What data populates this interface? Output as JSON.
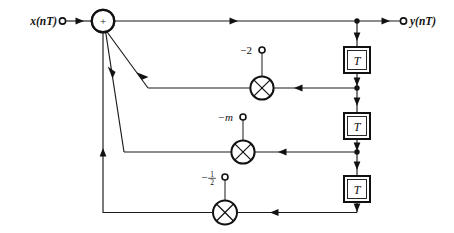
{
  "diagram": {
    "input": {
      "label": "x(nT)",
      "terminal": "input-terminal"
    },
    "output": {
      "label": "y(nT)",
      "terminal": "output-terminal"
    },
    "summer": {
      "symbol": "+",
      "name": "summing-junction"
    },
    "delays": [
      {
        "label": "T",
        "name": "delay-block-1"
      },
      {
        "label": "T",
        "name": "delay-block-2"
      },
      {
        "label": "T",
        "name": "delay-block-3"
      }
    ],
    "multipliers": [
      {
        "name": "multiplier-1",
        "coefficient": "−2",
        "coef_display": "-2",
        "style": "plain"
      },
      {
        "name": "multiplier-2",
        "coefficient": "−m",
        "coef_display": "-m",
        "style": "italic"
      },
      {
        "name": "multiplier-3",
        "coefficient": "−½",
        "coef_numerator": "1",
        "coef_denominator": "2",
        "coef_sign": "−",
        "style": "fraction"
      }
    ],
    "colors": {
      "line": "#1a1a1a",
      "fill": "#ffffff",
      "text": "#111111",
      "background": "#ffffff"
    }
  }
}
